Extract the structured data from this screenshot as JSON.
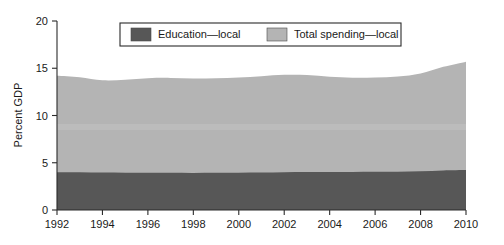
{
  "chart_data": {
    "type": "area",
    "stacked": true,
    "title": "",
    "subtitle": "",
    "xlabel": "",
    "ylabel": "Percent GDP",
    "xlim": [
      1992,
      2010
    ],
    "ylim": [
      0,
      20
    ],
    "grid": false,
    "legend_position": "top-center",
    "x_ticks": [
      1992,
      1994,
      1996,
      1998,
      2000,
      2002,
      2004,
      2006,
      2008,
      2010
    ],
    "y_ticks": [
      0,
      5,
      10,
      15,
      20
    ],
    "x": [
      1992,
      1993,
      1994,
      1995,
      1996,
      1997,
      1998,
      1999,
      2000,
      2001,
      2002,
      2003,
      2004,
      2005,
      2006,
      2007,
      2008,
      2009,
      2010
    ],
    "series": [
      {
        "name": "Education—local",
        "color": "#575757",
        "values": [
          4.0,
          4.0,
          3.97,
          3.95,
          3.94,
          3.93,
          3.92,
          3.94,
          3.95,
          3.97,
          4.0,
          4.02,
          4.03,
          4.03,
          4.04,
          4.06,
          4.1,
          4.18,
          4.22
        ]
      },
      {
        "name": "Total spending—local",
        "color": "#b4b4b4",
        "values": [
          14.2,
          14.05,
          13.73,
          13.78,
          13.95,
          13.98,
          13.92,
          13.95,
          14.02,
          14.15,
          14.3,
          14.28,
          14.1,
          14.0,
          14.02,
          14.12,
          14.45,
          15.15,
          15.7
        ]
      }
    ]
  },
  "legend": {
    "entries": [
      {
        "label": "Education—local",
        "color": "#575757"
      },
      {
        "label": "Total spending—local",
        "color": "#b4b4b4"
      }
    ]
  },
  "axes": {
    "y_title": "Percent GDP",
    "y_tick_labels": [
      "0",
      "5",
      "10",
      "15",
      "20"
    ],
    "x_tick_labels": [
      "1992",
      "1994",
      "1996",
      "1998",
      "2000",
      "2002",
      "2004",
      "2006",
      "2008",
      "2010"
    ]
  },
  "colors": {
    "education": "#575757",
    "total_spending": "#b4b4b4",
    "axis": "#2b2b2b",
    "background": "#ffffff"
  }
}
